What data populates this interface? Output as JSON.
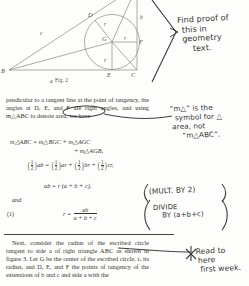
{
  "figure": {
    "caption": "Fig. 2",
    "vertex_labels": [
      "B",
      "C",
      "D",
      "E",
      "F",
      "G"
    ],
    "side_labels": [
      "a",
      "b",
      "c"
    ],
    "radius_labels": [
      "r",
      "r",
      "r"
    ]
  },
  "printed": {
    "paragraph_1": "pendicular to a tangent line at the point of tangency, the angles at D, E, and F are right angles, and using m△ABC to denote area, we have",
    "equation_1_line1": "m△ABC = m△BGC + m△AGC",
    "equation_1_line2": "+ m△AGB,",
    "equation_2": "ab = ar + br + cr,",
    "equation_3": "ab = r (a + b + c),",
    "and_label": "and",
    "equation_number": "(1)",
    "equation_4_lhs": "r =",
    "equation_4_num": "ab",
    "equation_4_den": "a + b + c",
    "fraction_half_num": "1",
    "fraction_half_den": "2",
    "paragraph_2": "Next, consider the radius of the escribed circle tangent to side a of right triangle ABC as shown in figure 3. Let G be the center of the escribed circle, rₐ its radius, and D, E, and F the points of tangency of the extensions of b and c and side a with the"
  },
  "annotations": {
    "find_proof": {
      "line1": "Find proof of",
      "line2": "this in",
      "line3": "geometry",
      "line4": "text."
    },
    "m_symbol": {
      "line1": "“m△” is the",
      "line2": "symbol for △",
      "line3": "area, not",
      "line4": "“m△ABC”."
    },
    "mult_by_two": "(MULT. BY 2)",
    "divide_by": {
      "line1": "DIVIDE",
      "line2": "BY (a+b+c)"
    },
    "read_to_here": {
      "line1": "Read to",
      "line2": "here",
      "line3": "first week.",
      "marker": "✳"
    }
  },
  "colors": {
    "page": "#fdfdfb",
    "print_ink": "#37352f",
    "hand_ink": "#343434",
    "figure_line": "#8a8880"
  }
}
